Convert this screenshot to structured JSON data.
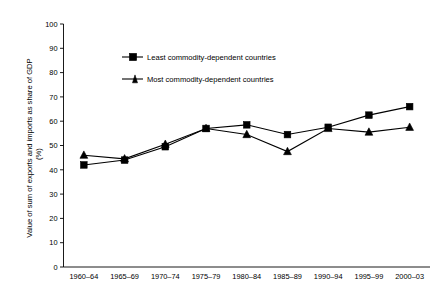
{
  "chart_data": {
    "type": "line",
    "title": "",
    "xlabel": "",
    "ylabel": "Value of sum of exports and imports as share of GDP (%)",
    "ylabel_line1": "Value of sum of exports and imports as share of GDP",
    "ylabel_line2": "(%)",
    "categories": [
      "1960–64",
      "1965–69",
      "1970–74",
      "1975–79",
      "1980–84",
      "1985–89",
      "1990–94",
      "1995–99",
      "2000–03"
    ],
    "series": [
      {
        "name": "Least commodity-dependent countries",
        "marker": "square",
        "values": [
          42,
          44,
          49.5,
          57,
          58.5,
          54.5,
          57.5,
          62.5,
          66
        ]
      },
      {
        "name": "Most commodity-dependent countries",
        "marker": "triangle",
        "values": [
          46,
          44.5,
          50.5,
          57,
          54.5,
          47.5,
          57,
          55.5,
          57.5
        ]
      }
    ],
    "ylim": [
      0,
      100
    ],
    "yticks": [
      0,
      10,
      20,
      30,
      40,
      50,
      60,
      70,
      80,
      90,
      100
    ],
    "ytick_labels": [
      "0",
      "10",
      "20",
      "30",
      "40",
      "50",
      "60",
      "70",
      "80",
      "90",
      "100"
    ],
    "grid": false,
    "legend_position": "upper-left-inside",
    "colors": {
      "axis": "#000000",
      "series_1": "#000000",
      "series_2": "#000000",
      "background": "#ffffff"
    }
  },
  "legend": {
    "entries": [
      {
        "label": "Least commodity-dependent countries",
        "marker": "square-marker-icon"
      },
      {
        "label": "Most commodity-dependent countries",
        "marker": "triangle-marker-icon"
      }
    ]
  }
}
